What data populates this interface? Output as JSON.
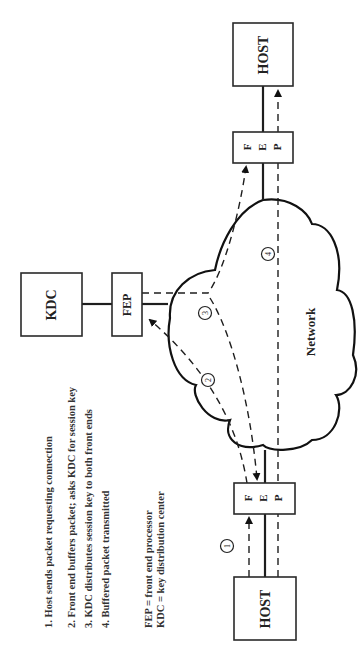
{
  "diagram": {
    "orientation": "rotated-90-ccw",
    "nodes": {
      "host_top": "HOST",
      "host_bottom": "HOST",
      "fep_top": [
        "F",
        "E",
        "P"
      ],
      "fep_bottom": [
        "F",
        "E",
        "P"
      ],
      "kdc": "KDC",
      "kdc_fep": "FEP",
      "network": "Network"
    },
    "steps": [
      "1",
      "2",
      "3",
      "4"
    ],
    "legend": {
      "items": [
        "1. Host sends packet requesting connection",
        "2. Front end buffers packet; asks KDC for session key",
        "3. KDC distributes session key to both front ends",
        "4. Buffered packet transmitted"
      ],
      "abbreviations": [
        "FEP = front end processor",
        "KDC = key distribution center"
      ]
    },
    "colors": {
      "line": "#1e1e1e",
      "background": "#ffffff"
    }
  }
}
